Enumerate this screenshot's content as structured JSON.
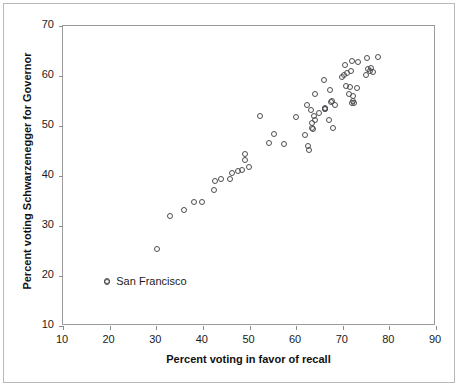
{
  "figure": {
    "width": 459,
    "height": 387,
    "background": "#ffffff",
    "border_color": "#b9b9b9",
    "plot_border_color": "#9a9a9a"
  },
  "annotation": {
    "label": "San Francisco",
    "marker_icon": "open-circle-marker",
    "x_value": 19.5,
    "y_value": 18.8
  },
  "chart_data": {
    "type": "scatter",
    "title": "",
    "subtitle": "",
    "xlabel": "Percent voting in favor of recall",
    "ylabel": "Percent voting Schwarzenegger for Governor",
    "xlim": [
      10,
      90
    ],
    "ylim": [
      10,
      70
    ],
    "xticks": [
      10,
      20,
      30,
      40,
      50,
      60,
      70,
      80,
      90
    ],
    "yticks": [
      10,
      20,
      30,
      40,
      50,
      60,
      70
    ],
    "grid": false,
    "legend": "none",
    "marker_style": "open-circle",
    "marker_color": "#4d4d52",
    "series": [
      {
        "name": "California counties",
        "points": [
          [
            19.5,
            18.8
          ],
          [
            30.1,
            25.4
          ],
          [
            33.0,
            32.0
          ],
          [
            36.0,
            33.3
          ],
          [
            38.0,
            34.8
          ],
          [
            39.8,
            34.9
          ],
          [
            42.4,
            37.2
          ],
          [
            42.6,
            39.0
          ],
          [
            43.8,
            39.5
          ],
          [
            45.8,
            39.5
          ],
          [
            46.3,
            40.7
          ],
          [
            47.6,
            41.1
          ],
          [
            48.3,
            41.2
          ],
          [
            49.0,
            44.4
          ],
          [
            49.1,
            43.2
          ],
          [
            49.8,
            41.8
          ],
          [
            52.2,
            52.0
          ],
          [
            54.2,
            46.6
          ],
          [
            55.2,
            48.4
          ],
          [
            57.4,
            46.4
          ],
          [
            59.9,
            51.8
          ],
          [
            61.9,
            48.2
          ],
          [
            62.3,
            54.2
          ],
          [
            62.6,
            46.0
          ],
          [
            62.8,
            45.3
          ],
          [
            63.2,
            53.3
          ],
          [
            63.4,
            50.6
          ],
          [
            63.5,
            49.6
          ],
          [
            63.6,
            49.4
          ],
          [
            63.9,
            52.0
          ],
          [
            64.0,
            56.5
          ],
          [
            64.1,
            51.2
          ],
          [
            64.8,
            52.6
          ],
          [
            65.9,
            59.2
          ],
          [
            66.1,
            53.5
          ],
          [
            66.2,
            53.4
          ],
          [
            66.3,
            53.6
          ],
          [
            67.0,
            51.2
          ],
          [
            67.3,
            57.3
          ],
          [
            67.5,
            54.8
          ],
          [
            67.6,
            55.0
          ],
          [
            67.9,
            49.7
          ],
          [
            68.3,
            54.2
          ],
          [
            69.8,
            59.8
          ],
          [
            70.2,
            60.2
          ],
          [
            70.5,
            62.2
          ],
          [
            70.6,
            58.0
          ],
          [
            70.9,
            60.6
          ],
          [
            71.3,
            56.4
          ],
          [
            71.5,
            57.9
          ],
          [
            71.8,
            61.0
          ],
          [
            71.9,
            63.0
          ],
          [
            72.0,
            54.7
          ],
          [
            72.1,
            55.0
          ],
          [
            72.2,
            56.0
          ],
          [
            72.4,
            54.6
          ],
          [
            73.1,
            57.6
          ],
          [
            73.3,
            62.9
          ],
          [
            74.9,
            60.3
          ],
          [
            75.2,
            63.6
          ],
          [
            75.5,
            61.5
          ],
          [
            75.8,
            61.0
          ],
          [
            76.1,
            61.6
          ],
          [
            76.4,
            60.9
          ],
          [
            77.5,
            63.9
          ]
        ]
      }
    ]
  }
}
